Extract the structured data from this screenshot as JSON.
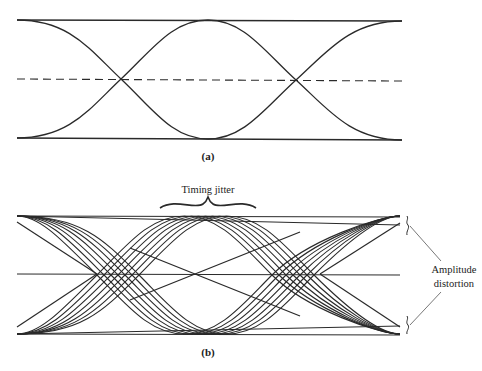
{
  "panels": [
    {
      "id": "a",
      "caption": "(a)",
      "description": "Ideal eye pattern"
    },
    {
      "id": "b",
      "caption": "(b)",
      "description": "Eye pattern with distortion",
      "annotations": {
        "timing_jitter": "Timing jitter",
        "amplitude_distortion_line1": "Amplitude",
        "amplitude_distortion_line2": "distortion"
      }
    }
  ],
  "colors": {
    "stroke": "#2a2a2a",
    "background": "#ffffff"
  }
}
